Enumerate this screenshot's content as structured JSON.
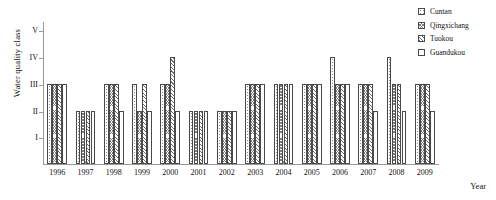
{
  "chart_data": {
    "type": "bar",
    "title": "",
    "xlabel": "Year",
    "ylabel": "Water quality class",
    "grid": false,
    "legend_position": "top-right",
    "categories": [
      "1996",
      "1997",
      "1998",
      "1999",
      "2000",
      "2001",
      "2002",
      "2003",
      "2004",
      "2005",
      "2006",
      "2007",
      "2008",
      "2009"
    ],
    "y_tick_labels": [
      "I",
      "II",
      "III",
      "IV",
      "V"
    ],
    "y_tick_values": [
      1,
      2,
      3,
      4,
      5
    ],
    "ylim": [
      0,
      5.35
    ],
    "series": [
      {
        "name": "Cuntan",
        "values": [
          3,
          2,
          3,
          3,
          3,
          2,
          2,
          3,
          3,
          3,
          4,
          3,
          4,
          3
        ]
      },
      {
        "name": "Qingxichang",
        "values": [
          3,
          2,
          3,
          2,
          3,
          2,
          2,
          3,
          3,
          3,
          3,
          3,
          3,
          3
        ]
      },
      {
        "name": "Tuokou",
        "values": [
          3,
          2,
          3,
          3,
          4,
          2,
          2,
          3,
          3,
          3,
          3,
          3,
          3,
          3
        ]
      },
      {
        "name": "Guandukou",
        "values": [
          3,
          2,
          2,
          2,
          2,
          2,
          2,
          3,
          3,
          3,
          3,
          2,
          2,
          2
        ]
      }
    ]
  },
  "axes": {
    "y_title": "Water quality class",
    "x_title": "Year"
  },
  "legend": {
    "items": [
      {
        "label": "Cuntan",
        "swatch": "dotted-square-icon"
      },
      {
        "label": "Qingxichang",
        "swatch": "crosshatch-square-icon"
      },
      {
        "label": "Tuokou",
        "swatch": "diagonal-hatch-square-icon"
      },
      {
        "label": "Guandukou",
        "swatch": "blank-square-icon"
      }
    ]
  },
  "colors": {
    "axis": "#9a9a9a",
    "bar_outline": "#4a4a4a",
    "text": "#111111",
    "background": "#ffffff"
  }
}
